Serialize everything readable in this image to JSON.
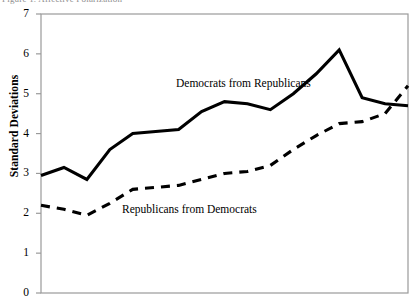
{
  "figure": {
    "clipped_header_text": "Figure 1. Affective Polarization",
    "y_axis_title": "Standard Deviations"
  },
  "chart_data": {
    "type": "line",
    "title": "",
    "xlabel": "",
    "ylabel": "Standard Deviations",
    "ylim": [
      0,
      7
    ],
    "yticks": [
      0,
      1,
      2,
      3,
      4,
      5,
      6,
      7
    ],
    "ytick_labels": [
      "0",
      "1",
      "2",
      "3",
      "4",
      "5",
      "6",
      "7"
    ],
    "xlim": [
      0,
      16
    ],
    "xticks": [],
    "xtick_labels": [],
    "grid": false,
    "legend_position": "inline-annotation",
    "x": [
      0,
      1,
      2,
      3,
      4,
      5,
      6,
      7,
      8,
      9,
      10,
      11,
      12,
      13,
      14,
      15,
      16
    ],
    "series": [
      {
        "name": "Democrats from Republicans",
        "style": "solid",
        "color": "#000000",
        "values": [
          2.95,
          3.15,
          2.85,
          3.6,
          4.0,
          4.05,
          4.1,
          4.55,
          4.8,
          4.75,
          4.6,
          5.0,
          5.5,
          6.1,
          4.9,
          4.75,
          4.7
        ]
      },
      {
        "name": "Republicans from Democrats",
        "style": "dashed",
        "color": "#000000",
        "values": [
          2.2,
          2.1,
          1.95,
          2.25,
          2.6,
          2.65,
          2.7,
          2.85,
          3.0,
          3.05,
          3.2,
          3.6,
          3.95,
          4.25,
          4.3,
          4.5,
          5.2
        ]
      }
    ],
    "annotations": [
      {
        "text": "Democrats from Republicans",
        "x_px": 176,
        "y_px": 77
      },
      {
        "text": "Republicans from Democrats",
        "x_px": 122,
        "y_px": 203
      }
    ]
  },
  "axis_colors": {
    "frame": "#9a9a9a",
    "line": "#000000"
  }
}
